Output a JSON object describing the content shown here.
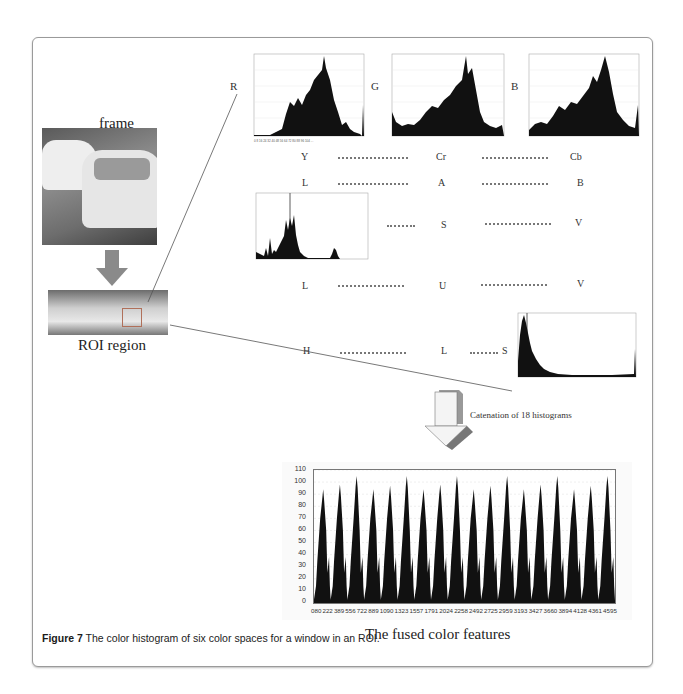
{
  "figure": {
    "caption_label": "Figure 7",
    "caption_text": " The color histogram of six color spaces for a window in an ROI."
  },
  "left_panel": {
    "frame_title": "frame",
    "roi_title": "ROI region"
  },
  "color_spaces": [
    {
      "name": "RGB",
      "channels": [
        "R",
        "G",
        "B"
      ],
      "shown_as": "histograms"
    },
    {
      "name": "YCrCb",
      "channels": [
        "Y",
        "Cr",
        "Cb"
      ],
      "shown_as": "labels"
    },
    {
      "name": "LAB",
      "channels": [
        "L",
        "A",
        "B"
      ],
      "shown_as": "labels"
    },
    {
      "name": "HSV",
      "channels": [
        "H",
        "S",
        "V"
      ],
      "shown_as": "H histogram + labels"
    },
    {
      "name": "LUV",
      "channels": [
        "L",
        "U",
        "V"
      ],
      "shown_as": "labels"
    },
    {
      "name": "HLS",
      "channels": [
        "H",
        "L",
        "S"
      ],
      "shown_as": "labels + S histogram"
    }
  ],
  "labels": {
    "r": "R",
    "g": "G",
    "b": "B",
    "y": "Y",
    "cr": "Cr",
    "cb": "Cb",
    "lab_l": "L",
    "lab_a": "A",
    "lab_b": "B",
    "hsv_h": "H",
    "hsv_s": "S",
    "hsv_v": "V",
    "luv_l": "L",
    "luv_u": "U",
    "luv_v": "V",
    "hls_h": "H",
    "hls_l": "L",
    "hls_s": "S"
  },
  "arrow_label": "Catenation of 18 histograms",
  "fused_title": "The fused color features",
  "chart_data": [
    {
      "type": "bar",
      "title": "R histogram",
      "xlabel": "bin",
      "ylabel": "count",
      "shape": "unimodal, rising from near zero around bin 60 to peak near bin 175, falling to low values by bin 230, spike at 255",
      "bins": [
        0,
        16,
        32,
        48,
        64,
        80,
        96,
        112,
        128,
        144,
        160,
        176,
        192,
        208,
        224,
        240,
        255
      ],
      "values": [
        1,
        1,
        1,
        3,
        8,
        45,
        50,
        55,
        75,
        90,
        95,
        110,
        55,
        20,
        12,
        5,
        40
      ]
    },
    {
      "type": "bar",
      "title": "G histogram",
      "shape": "starts moderate, dips, rises to peak near bin 190, then falls",
      "bins": [
        0,
        16,
        32,
        48,
        64,
        80,
        96,
        112,
        128,
        144,
        160,
        176,
        192,
        208,
        224,
        240,
        255
      ],
      "values": [
        35,
        20,
        15,
        18,
        20,
        25,
        35,
        40,
        45,
        55,
        65,
        80,
        95,
        40,
        15,
        10,
        12
      ]
    },
    {
      "type": "bar",
      "title": "B histogram",
      "shape": "low start, gradual rise, peak near bin 190, fall, spike at end",
      "bins": [
        0,
        16,
        32,
        48,
        64,
        80,
        96,
        112,
        128,
        144,
        160,
        176,
        192,
        208,
        224,
        240,
        255
      ],
      "values": [
        5,
        18,
        20,
        18,
        22,
        35,
        40,
        35,
        45,
        50,
        75,
        80,
        95,
        60,
        25,
        15,
        35
      ]
    },
    {
      "type": "bar",
      "title": "H histogram (HSV)",
      "shape": "sparse spikes, tall spike near bin 75, cluster 40-90, small mound near bin 170",
      "bins": [
        0,
        20,
        40,
        60,
        70,
        75,
        80,
        90,
        100,
        120,
        140,
        160,
        170,
        180
      ],
      "values": [
        10,
        5,
        35,
        30,
        60,
        100,
        65,
        25,
        5,
        2,
        1,
        5,
        25,
        2
      ]
    },
    {
      "type": "bar",
      "title": "S histogram (HLS)",
      "shape": "sharp peak at low saturation, exponential decay, spike at 255",
      "bins": [
        0,
        8,
        16,
        32,
        48,
        64,
        96,
        128,
        160,
        192,
        224,
        255
      ],
      "values": [
        95,
        100,
        70,
        35,
        15,
        6,
        3,
        2,
        2,
        3,
        3,
        35
      ]
    },
    {
      "type": "bar",
      "title": "The fused color features",
      "xlabel": "",
      "ylabel": "",
      "ylim": [
        0,
        110
      ],
      "yticks": [
        0,
        10,
        20,
        30,
        40,
        50,
        60,
        70,
        80,
        90,
        100,
        110
      ],
      "xtick_labels": [
        "0",
        "80",
        "222",
        "389",
        "556",
        "722",
        "889",
        "1090",
        "1323",
        "1557",
        "1791",
        "2024",
        "2258",
        "2492",
        "2725",
        "2959",
        "3193",
        "3427",
        "3660",
        "3894",
        "4128",
        "4361",
        "4595"
      ],
      "grid": true,
      "n_concatenated_histograms": 18,
      "series": [
        {
          "name": "peak height per concatenated histogram",
          "values": [
            94,
            98,
            105,
            94,
            97,
            105,
            94,
            98,
            105,
            94,
            97,
            105,
            94,
            98,
            105,
            94,
            97,
            105
          ]
        }
      ]
    }
  ]
}
